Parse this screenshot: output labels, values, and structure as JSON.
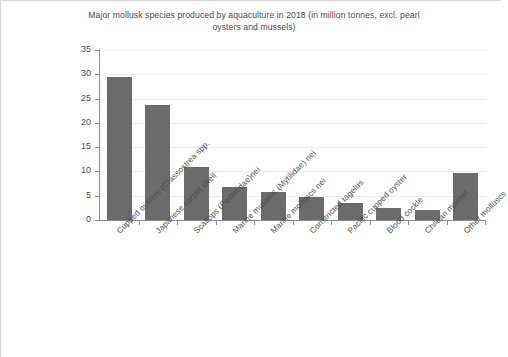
{
  "chart_data": {
    "type": "bar",
    "title": "Major mollusk species produced by aquaculture in 2018 (in million tonnes, excl. pearl oysters and mussels)",
    "xlabel": "",
    "ylabel": "",
    "ylim": [
      0,
      35
    ],
    "ytick_step": 5,
    "grid": true,
    "legend": "none",
    "bar_color": "#6b6b6b",
    "categories": [
      "Cupped oysters (Crassostrea spp.",
      "Japanese carpet shell",
      "Scallops (Pectinidae)nei",
      "Marine mussels (Mytilidae) nei",
      "Marine molluscs nei",
      "Constricted tagelus",
      "Pacific cupped oyster",
      "Blood cockle",
      "Chilean mussel",
      "Other molluscs"
    ],
    "values": [
      29.5,
      23.7,
      11.0,
      6.7,
      5.8,
      4.8,
      3.5,
      2.4,
      2.0,
      9.7
    ],
    "yticks": [
      "0",
      "5",
      "10",
      "15",
      "20",
      "25",
      "30",
      "35"
    ]
  }
}
